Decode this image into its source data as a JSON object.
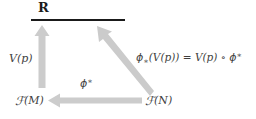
{
  "diagram": {
    "kind": "commutative-triangle",
    "background_color": "#ffffff",
    "arrow_color": "#c9c9c9",
    "text_color": "#3f3f3f",
    "rule_color": "#1a1a1a",
    "nodes": {
      "apex": {
        "name": "real-numbers",
        "text": "R",
        "style": "bold-serif",
        "underline": true
      },
      "bottom_left": {
        "name": "functions-on-M",
        "text": "ℱ(M)",
        "script_letter": "ℱ",
        "argument": "(M)"
      },
      "bottom_right": {
        "name": "functions-on-N",
        "text": "ℱ(N)",
        "script_letter": "ℱ",
        "argument": "(N)"
      }
    },
    "arrows": [
      {
        "name": "arrow-FM-to-R",
        "from": "ℱ(M)",
        "to": "R",
        "direction": "up",
        "label": "V(p)"
      },
      {
        "name": "arrow-FN-to-R",
        "from": "ℱ(N)",
        "to": "R",
        "direction": "up-left",
        "label": "ϕ∗(V(p)) = V(p) ∘ ϕ∗"
      },
      {
        "name": "arrow-FN-to-FM",
        "from": "ℱ(N)",
        "to": "ℱ(M)",
        "direction": "left",
        "label": "ϕ∗"
      }
    ],
    "labels": {
      "vertical_map": "V(p)",
      "pullback": {
        "symbol": "ϕ",
        "star": "∗"
      },
      "pushforward_equation": {
        "lhs_symbol": "ϕ",
        "lhs_sub": "∗",
        "lhs_arg": "(V(p))",
        "equals": "=",
        "rhs_first": "V(p)",
        "compose": "∘",
        "rhs_symbol": "ϕ",
        "rhs_sup": "∗",
        "plain": "ϕ∗(V(p)) = V(p) ∘ ϕ∗"
      }
    }
  }
}
